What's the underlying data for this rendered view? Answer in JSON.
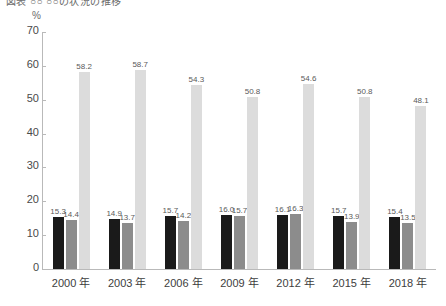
{
  "title": "図表 ○○ ○○の状況の推移",
  "unit": "%",
  "chart_data": {
    "type": "bar",
    "title": "図表 ○○ ○○の状況の推移",
    "xlabel": "",
    "ylabel": "%",
    "ylim": [
      0,
      70
    ],
    "yticks": [
      0,
      10,
      20,
      30,
      40,
      50,
      60,
      70
    ],
    "ytick_labels": [
      "0",
      "10",
      "20",
      "30",
      "40",
      "50",
      "60",
      "70"
    ],
    "grid": false,
    "legend_position": "none",
    "categories": [
      "2000 年",
      "2003 年",
      "2006 年",
      "2009 年",
      "2012 年",
      "2015 年",
      "2018 年"
    ],
    "series": [
      {
        "name": "series-1",
        "color": "#1a1a1a",
        "values": [
          15.3,
          14.9,
          15.7,
          16.0,
          16.1,
          15.7,
          15.4
        ],
        "labels": [
          "15.3",
          "14.9",
          "15.7",
          "16.0",
          "16.1",
          "15.7",
          "15.4"
        ]
      },
      {
        "name": "series-2",
        "color": "#8c8c8c",
        "values": [
          14.4,
          13.7,
          14.2,
          15.7,
          16.3,
          13.9,
          13.5
        ],
        "labels": [
          "14.4",
          "13.7",
          "14.2",
          "15.7",
          "16.3",
          "13.9",
          "13.5"
        ]
      },
      {
        "name": "series-3",
        "color": "#dcdcdc",
        "values": [
          58.2,
          58.7,
          54.3,
          50.8,
          54.6,
          50.8,
          48.1
        ],
        "labels": [
          "58.2",
          "58.7",
          "54.3",
          "50.8",
          "54.6",
          "50.8",
          "48.1"
        ]
      }
    ]
  }
}
